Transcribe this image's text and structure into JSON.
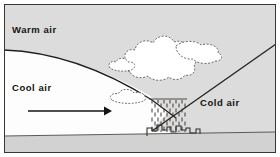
{
  "figure": {
    "type": "weather-cross-section-diagram",
    "title_visible": false,
    "frame": {
      "border_color": "#3a3733",
      "border_width_px": 1,
      "outer_background": "#ffffff",
      "x": 4,
      "y": 4,
      "width": 272,
      "height": 149
    },
    "regions": {
      "warm_air": {
        "label": "Warm air",
        "fill": "#dcdcdc",
        "label_x": 12,
        "label_y": 33
      },
      "cool_air": {
        "label": "Cool air",
        "fill": "#fdfdfd",
        "label_x": 12,
        "label_y": 91
      },
      "cold_air": {
        "label": "Cold air",
        "fill": "#dcdcdc",
        "label_x": 200,
        "label_y": 106
      },
      "ground": {
        "label": "",
        "fill": "#d2d2d2",
        "top_edge_left_y": 134,
        "top_edge_right_y": 130
      }
    },
    "fronts": {
      "warm_front": {
        "name": "warm-front-boundary",
        "style": "curved",
        "stroke": "#221f1c",
        "stroke_width_px": 1.3
      },
      "cold_front": {
        "name": "cold-front-boundary",
        "style": "straight-diagonal",
        "stroke": "#221f1c",
        "stroke_width_px": 1.3
      }
    },
    "arrow": {
      "name": "cool-air-flow-arrow",
      "direction": "right",
      "x1": 28,
      "y1": 111,
      "x2": 107,
      "y2": 111,
      "stroke": "#15130f",
      "stroke_width_px": 1.6
    },
    "clouds": [
      {
        "name": "cumulonimbus-main",
        "fill": "#ffffff",
        "outline": "#6d6d6d"
      },
      {
        "name": "cloud-anvil-right",
        "fill": "#ffffff",
        "outline": "#6d6d6d"
      },
      {
        "name": "cloud-small-left",
        "fill": "#ffffff",
        "outline": "#6d6d6d"
      },
      {
        "name": "cloud-stratus-low",
        "fill": "#ffffff",
        "outline": "#6d6d6d"
      }
    ],
    "precipitation": {
      "name": "rain-shaft",
      "stroke": "#3d3a36",
      "dash_count": 78
    },
    "buildings": {
      "name": "city-skyline",
      "stroke": "#2d2a27",
      "fill": "none"
    }
  }
}
